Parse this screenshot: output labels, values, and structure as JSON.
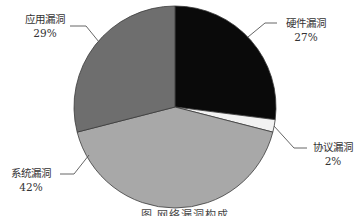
{
  "chart_data": {
    "type": "pie",
    "title": "",
    "caption": "图 网络漏洞构成",
    "start_angle_deg": 0,
    "direction": "clockwise",
    "slices": [
      {
        "label": "硬件漏洞",
        "value": 27,
        "display": "27%",
        "color": "#0a0a0a"
      },
      {
        "label": "协议漏洞",
        "value": 2,
        "display": "2%",
        "color": "#f2f2f2"
      },
      {
        "label": "系统漏洞",
        "value": 42,
        "display": "42%",
        "color": "#a8a8a8"
      },
      {
        "label": "应用漏洞",
        "value": 29,
        "display": "29%",
        "color": "#6e6e6e"
      }
    ],
    "legend": "none (leader-line data labels)"
  },
  "labels": {
    "hardware": {
      "name": "硬件漏洞",
      "pct": "27%"
    },
    "protocol": {
      "name": "协议漏洞",
      "pct": "2%"
    },
    "system": {
      "name": "系统漏洞",
      "pct": "42%"
    },
    "application": {
      "name": "应用漏洞",
      "pct": "29%"
    }
  }
}
